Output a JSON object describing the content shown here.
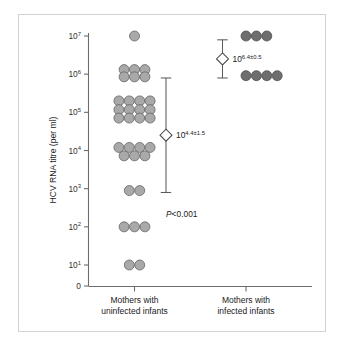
{
  "chart_data": {
    "type": "scatter",
    "title": "",
    "subtitle": "",
    "xlabel": "",
    "ylabel": "HCV RNA titre (per ml)",
    "y_scale": "log10",
    "ylim_exp": [
      0.4,
      7.35
    ],
    "grid": false,
    "legend": "none",
    "y_ticks": [
      {
        "label_base": "0",
        "label_exp": "",
        "exp_value": 0.45
      },
      {
        "label_base": "10",
        "label_exp": "1",
        "exp_value": 1
      },
      {
        "label_base": "10",
        "label_exp": "2",
        "exp_value": 2
      },
      {
        "label_base": "10",
        "label_exp": "3",
        "exp_value": 3
      },
      {
        "label_base": "10",
        "label_exp": "4",
        "exp_value": 4
      },
      {
        "label_base": "10",
        "label_exp": "5",
        "exp_value": 5
      },
      {
        "label_base": "10",
        "label_exp": "6",
        "exp_value": 6
      },
      {
        "label_base": "10",
        "label_exp": "7",
        "exp_value": 7
      }
    ],
    "categories": [
      "Mothers with uninfected infants",
      "Mothers with infected infants"
    ],
    "category_label_lines": [
      [
        "Mothers with",
        "uninfected infants"
      ],
      [
        "Mothers with",
        "infected infants"
      ]
    ],
    "series": [
      {
        "name": "Mothers with uninfected infants",
        "marker": "circle",
        "fill": "#a9a9a9",
        "stroke": "#5f5f5f",
        "n": 33,
        "rows": [
          {
            "exp_value": 7.0,
            "count": 1,
            "offsets": [
              0
            ]
          },
          {
            "exp_value": 6.12,
            "count": 3,
            "offsets": [
              -1,
              0,
              1
            ]
          },
          {
            "exp_value": 5.93,
            "count": 3,
            "offsets": [
              -1,
              0,
              1
            ]
          },
          {
            "exp_value": 5.3,
            "count": 4,
            "offsets": [
              -1.5,
              -0.5,
              0.5,
              1.5
            ]
          },
          {
            "exp_value": 5.07,
            "count": 4,
            "offsets": [
              -1.5,
              -0.5,
              0.5,
              1.5
            ]
          },
          {
            "exp_value": 4.85,
            "count": 4,
            "offsets": [
              -1.5,
              -0.5,
              0.5,
              1.5
            ]
          },
          {
            "exp_value": 4.08,
            "count": 4,
            "offsets": [
              -1.5,
              -0.5,
              0.5,
              1.5
            ]
          },
          {
            "exp_value": 3.86,
            "count": 3,
            "offsets": [
              -1,
              0,
              1
            ]
          },
          {
            "exp_value": 2.95,
            "count": 2,
            "offsets": [
              -0.5,
              0.5
            ]
          },
          {
            "exp_value": 2.0,
            "count": 3,
            "offsets": [
              -1,
              0,
              1
            ]
          },
          {
            "exp_value": 1.0,
            "count": 2,
            "offsets": [
              -0.5,
              0.5
            ]
          }
        ],
        "mean_exp": 4.4,
        "sd_exp": 1.5,
        "mean_label_base": "10",
        "mean_label_exp": "4.4±1.5"
      },
      {
        "name": "Mothers with infected infants",
        "marker": "circle",
        "fill": "#6e6e6e",
        "stroke": "#4a4a4a",
        "n": 7,
        "rows": [
          {
            "exp_value": 7.0,
            "count": 3,
            "offsets": [
              0,
              1,
              2
            ]
          },
          {
            "exp_value": 5.96,
            "count": 4,
            "offsets": [
              0,
              1,
              2,
              3
            ]
          }
        ],
        "mean_exp": 6.4,
        "sd_exp": 0.5,
        "mean_label_base": "10",
        "mean_label_exp": "6.4±0.5"
      }
    ],
    "annotations": [
      {
        "name": "p-value",
        "text_italic": "P",
        "text_rest": "<0.001",
        "exp_value": 2.25
      }
    ]
  },
  "figure": {
    "border_color": "#d2d2d2",
    "background": "#ffffff",
    "axis_color": "#6d6d6d"
  }
}
